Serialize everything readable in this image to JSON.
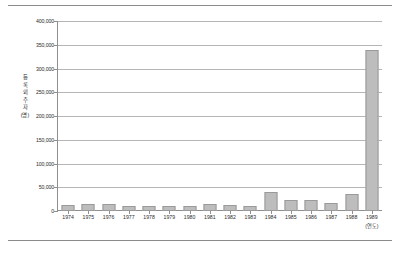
{
  "chart_data": {
    "type": "bar",
    "title": "",
    "subtitle": "",
    "xlabel": "(연도)",
    "ylabel": "등록 외주자 (명)",
    "ylabel_chars": [
      "등",
      "록",
      "외",
      "주",
      "자",
      "(명)"
    ],
    "categories": [
      "1974",
      "1975",
      "1976",
      "1977",
      "1978",
      "1979",
      "1980",
      "1981",
      "1982",
      "1983",
      "1984",
      "1985",
      "1986",
      "1987",
      "1988",
      "1989"
    ],
    "values": [
      12000,
      15000,
      14000,
      10500,
      10000,
      10000,
      10500,
      14000,
      12000,
      11000,
      40000,
      23000,
      24000,
      17000,
      36000,
      340000
    ],
    "ylim": [
      0,
      400000
    ],
    "ytick_values": [
      0,
      50000,
      100000,
      150000,
      200000,
      250000,
      300000,
      350000,
      400000
    ],
    "ytick_labels": [
      "0",
      "50,000",
      "100,000",
      "150,000",
      "200,000",
      "250,000",
      "300,000",
      "350,000",
      "400,000"
    ],
    "grid": true,
    "legend": false,
    "legend_position": "none",
    "bar_color": "#bdbdbd",
    "bar_edge_color": "#9a9a9a",
    "gridline_color": "#b5b5b5",
    "axis_color": "#8f8f8f",
    "background_color": "#ffffff"
  }
}
